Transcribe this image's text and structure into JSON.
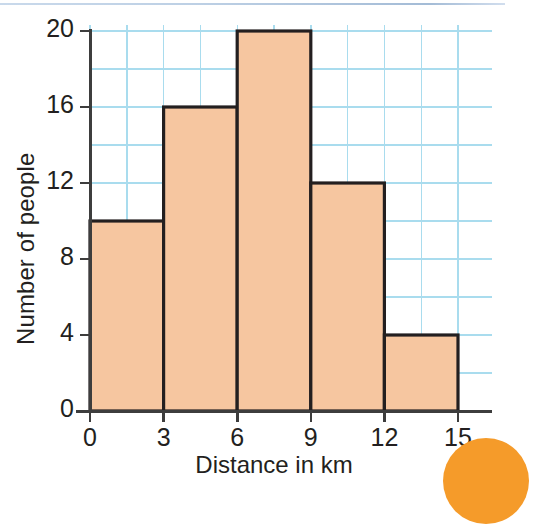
{
  "figure": {
    "background_color": "#ffffff",
    "top_rule_color": "#aac2dd",
    "corner_decoration": "orange-circle",
    "corner_decoration_color": "#f59b2a"
  },
  "chart_data": {
    "type": "bar",
    "title": "",
    "subtitle": "",
    "xlabel": "Distance in km",
    "ylabel": "Number of people",
    "categories": [
      "0-3",
      "3-6",
      "6-9",
      "9-12",
      "12-15"
    ],
    "bin_edges": [
      0,
      3,
      6,
      9,
      12,
      15
    ],
    "values": [
      10,
      16,
      20,
      12,
      4
    ],
    "xlim": [
      0,
      15
    ],
    "ylim": [
      0,
      20
    ],
    "x_ticks": [
      "0",
      "3",
      "6",
      "9",
      "12",
      "15"
    ],
    "x_tick_values": [
      0,
      3,
      6,
      9,
      12,
      15
    ],
    "y_ticks": [
      "0",
      "4",
      "8",
      "12",
      "16",
      "20"
    ],
    "y_tick_values": [
      0,
      4,
      8,
      12,
      16,
      20
    ],
    "grid": true,
    "grid_color": "#a9dcee",
    "grid_x_step": 1.5,
    "grid_y_step": 2,
    "legend": false,
    "legend_position": "none",
    "bar_fill_color": "#f6c6a0",
    "bar_edge_color": "#231f20",
    "axis_color": "#3d3d3d"
  }
}
